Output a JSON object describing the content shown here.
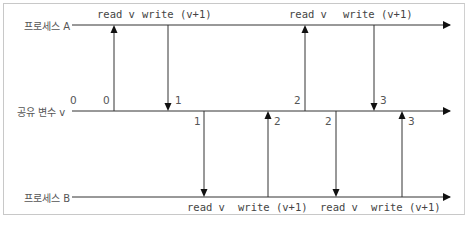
{
  "diagram": {
    "lanes": [
      {
        "id": "process-a",
        "label": "프로세스 A"
      },
      {
        "id": "shared-var",
        "label": "공유 변수 v"
      },
      {
        "id": "process-b",
        "label": "프로세스 B"
      }
    ],
    "ops": {
      "a1_read": "read v",
      "a1_write": "write (v+1)",
      "a2_read": "read v",
      "a2_write": "write (v+1)",
      "b1_read": "read v",
      "b1_write": "write (v+1)",
      "b2_read": "read v",
      "b2_write": "write (v+1)"
    },
    "values": {
      "initial": "0",
      "a1_read_val": "0",
      "a1_write_val": "1",
      "b1_read_val": "1",
      "b1_write_val": "2",
      "a2_read_val": "2",
      "b2_read_val": "2",
      "a2_write_val": "3",
      "b2_write_val": "3"
    },
    "colors": {
      "line": "#222222",
      "text": "#555555",
      "border": "#c8c8c8"
    }
  }
}
